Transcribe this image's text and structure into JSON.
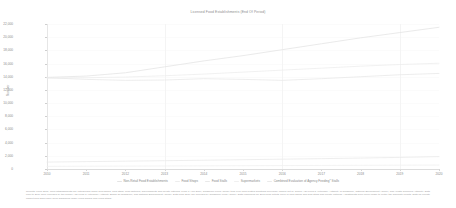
{
  "chart_data": {
    "type": "line",
    "title": "Licensed Food Establishments (End Of Period)",
    "xlabel": "",
    "ylabel": "Number",
    "x": [
      2010,
      2011,
      2012,
      2013,
      2014,
      2015,
      2016,
      2017,
      2018,
      2019,
      2020
    ],
    "xticklabels": [
      "2010",
      "2011",
      "2012",
      "2013",
      "2014",
      "2015",
      "2016",
      "2017",
      "2018",
      "2019",
      "2020"
    ],
    "yticklabels": [
      "0",
      "2,000",
      "4,000",
      "6,000",
      "8,000",
      "10,000",
      "12,000",
      "14,000",
      "16,000",
      "18,000",
      "20,000",
      "22,000"
    ],
    "ytickvalues": [
      0,
      2000,
      4000,
      6000,
      8000,
      10000,
      12000,
      14000,
      16000,
      18000,
      20000,
      22000
    ],
    "ylim": [
      0,
      22000
    ],
    "xlim": [
      2010,
      2020
    ],
    "grid": true,
    "legend_position": "bottom",
    "series": [
      {
        "name": "Non-Retail Food Establishments",
        "color": "#e4e4e4",
        "values": [
          13900,
          14100,
          14600,
          15500,
          16400,
          17200,
          18100,
          19000,
          19900,
          20700,
          21500
        ]
      },
      {
        "name": "Food Shops",
        "color": "#ededed",
        "values": [
          13800,
          13850,
          13950,
          14150,
          14400,
          14700,
          15000,
          15300,
          15600,
          15850,
          16050
        ]
      },
      {
        "name": "Food Stalls",
        "color": "#e9e9e9",
        "values": [
          13850,
          13600,
          13450,
          13500,
          13700,
          13600,
          13450,
          13700,
          14000,
          14300,
          14500
        ]
      },
      {
        "name": "Supermarkets",
        "color": "#f0f0f0",
        "values": [
          400,
          420,
          440,
          460,
          480,
          500,
          520,
          540,
          560,
          580,
          600
        ]
      },
      {
        "name": "Combined Evaluation of Agency Feeding* Stalls",
        "color": "#eaeaea",
        "values": [
          1050,
          1120,
          1190,
          1260,
          1330,
          1410,
          1490,
          1570,
          1660,
          1760,
          1880
        ]
      }
    ]
  },
  "footnote": {
    "text": "Reports: From 2001, food establishments are categorised under food shops, food stalls, food factories, supermarkets and private catering. From 1 April 2019, Singapore Food Agency took over food-related functions previously carried out by former Agri-Food & Veterinary Authority of Singapore, National Environment Agency, and Health Sciences Authority. Data prior to 2019 were provided by the former Agri-Food & Veterinary Authority Board Of Singapore, and National Environment Agency. Data from 2019 are provided by Singapore Food Agency. Data regrouped for 2013 food outlets cover in food shops and food stalls and private catering. Adjustments were never made to rectify the duplicate counts. Data for Private Market from 2000 have been subsumed under 'Food Shops' and 'Food Stalls'."
  }
}
